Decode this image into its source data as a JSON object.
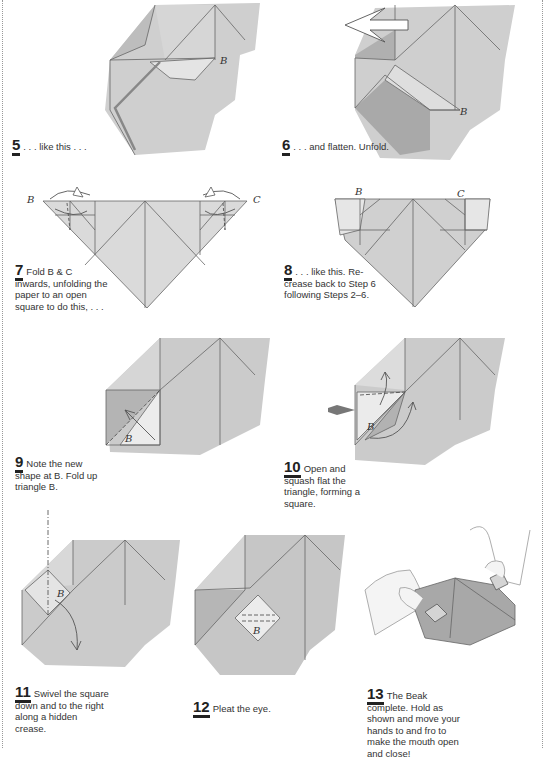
{
  "steps": [
    {
      "number": "5",
      "text": ". . . like this . . .",
      "labels": [
        "B"
      ]
    },
    {
      "number": "6",
      "text": ". . . and flatten. Unfold.",
      "labels": [
        "B"
      ]
    },
    {
      "number": "7",
      "text": "Fold B & C inwards, unfolding the paper to an open square to do this, . . .",
      "labels": [
        "B",
        "C"
      ]
    },
    {
      "number": "8",
      "text": ". . . like this. Re-crease back to Step 6 following Steps 2–6.",
      "labels": [
        "B",
        "C"
      ]
    },
    {
      "number": "9",
      "text": "Note the new shape at B. Fold up triangle B.",
      "labels": [
        "B"
      ]
    },
    {
      "number": "10",
      "text": "Open and squash flat the triangle, forming a square.",
      "labels": [
        "B"
      ]
    },
    {
      "number": "11",
      "text": "Swivel the square down and to the right along a hidden crease.",
      "labels": [
        "B"
      ]
    },
    {
      "number": "12",
      "text": "Pleat the eye.",
      "labels": [
        "B"
      ]
    },
    {
      "number": "13",
      "text": "The Beak complete. Hold as shown and move your hands to and fro to make the mouth open and close!",
      "labels": []
    }
  ],
  "colors": {
    "paper_light": "#dcdcdc",
    "paper_mid": "#c4c4c4",
    "paper_dark": "#a8a8a8",
    "line": "#666666"
  }
}
